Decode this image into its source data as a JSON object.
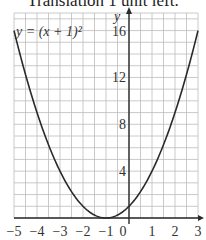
{
  "heading": "Translation 1 unit left.",
  "chart_data": {
    "type": "line",
    "title": "Translation 1 unit left.",
    "xlabel": "",
    "ylabel": "y",
    "equation_label": "y = (x + 1)²",
    "xlim": [
      -5,
      3
    ],
    "ylim": [
      0,
      17.5
    ],
    "x_ticks": [
      "−5",
      "−4",
      "−3",
      "−2",
      "−1",
      "0",
      "1",
      "2",
      "3"
    ],
    "y_ticks": [
      "4",
      "8",
      "12",
      "16"
    ],
    "grid": true,
    "series": [
      {
        "name": "y = (x + 1)²",
        "x": [
          -5,
          -4.5,
          -4,
          -3.5,
          -3,
          -2.5,
          -2,
          -1.5,
          -1,
          -0.5,
          0,
          0.5,
          1,
          1.5,
          2,
          2.5,
          3
        ],
        "values": [
          16,
          12.25,
          9,
          6.25,
          4,
          2.25,
          1,
          0.25,
          0,
          0.25,
          1,
          2.25,
          4,
          6.25,
          9,
          12.25,
          16
        ]
      }
    ],
    "colors": {
      "curve": "#2a2a2a",
      "grid": "#bdbdbd",
      "axis": "#2a2a2a"
    }
  }
}
